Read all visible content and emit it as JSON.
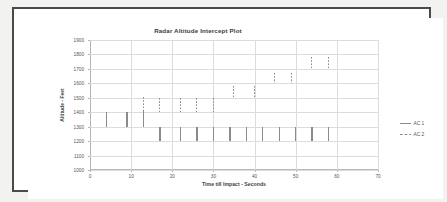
{
  "chart_data": {
    "type": "bar",
    "title": "Radar Altitude Intercept Plot",
    "xlabel": "Time till Impact - Seconds",
    "ylabel": "Altitude - Feet",
    "xlim": [
      0,
      70
    ],
    "ylim": [
      1000,
      1900
    ],
    "xticks": [
      "0",
      "10",
      "20",
      "30",
      "40",
      "50",
      "60",
      "70"
    ],
    "yticks": [
      "1000",
      "1100",
      "1200",
      "1300",
      "1400",
      "1500",
      "1600",
      "1700",
      "1800",
      "1900"
    ],
    "grid": true,
    "legend_position": "right",
    "legend": [
      "AC 1",
      "AC 2"
    ],
    "note": "Each data point is drawn as a vertical altitude-band segment (low to high) at a given time-till-impact.",
    "series": [
      {
        "name": "AC 1",
        "style": "solid",
        "color": "#8b8b8b",
        "points": [
          {
            "x": 4,
            "low": 1300,
            "high": 1400
          },
          {
            "x": 9,
            "low": 1300,
            "high": 1400
          },
          {
            "x": 13,
            "low": 1300,
            "high": 1410
          },
          {
            "x": 17,
            "low": 1200,
            "high": 1300
          },
          {
            "x": 22,
            "low": 1200,
            "high": 1300
          },
          {
            "x": 26,
            "low": 1200,
            "high": 1300
          },
          {
            "x": 30,
            "low": 1200,
            "high": 1300
          },
          {
            "x": 34,
            "low": 1200,
            "high": 1300
          },
          {
            "x": 38,
            "low": 1200,
            "high": 1300
          },
          {
            "x": 42,
            "low": 1200,
            "high": 1300
          },
          {
            "x": 46,
            "low": 1200,
            "high": 1300
          },
          {
            "x": 50,
            "low": 1200,
            "high": 1300
          },
          {
            "x": 54,
            "low": 1200,
            "high": 1300
          },
          {
            "x": 58,
            "low": 1200,
            "high": 1300
          }
        ]
      },
      {
        "name": "AC 2",
        "style": "dashed",
        "color": "#8b8b8b",
        "points": [
          {
            "x": 13,
            "low": 1400,
            "high": 1505
          },
          {
            "x": 17,
            "low": 1400,
            "high": 1500
          },
          {
            "x": 22,
            "low": 1400,
            "high": 1500
          },
          {
            "x": 26,
            "low": 1400,
            "high": 1500
          },
          {
            "x": 30,
            "low": 1400,
            "high": 1500
          },
          {
            "x": 35,
            "low": 1500,
            "high": 1585
          },
          {
            "x": 40,
            "low": 1500,
            "high": 1585
          },
          {
            "x": 45,
            "low": 1600,
            "high": 1675
          },
          {
            "x": 49,
            "low": 1600,
            "high": 1675
          },
          {
            "x": 54,
            "low": 1700,
            "high": 1780
          },
          {
            "x": 58,
            "low": 1700,
            "high": 1780
          }
        ]
      }
    ]
  }
}
